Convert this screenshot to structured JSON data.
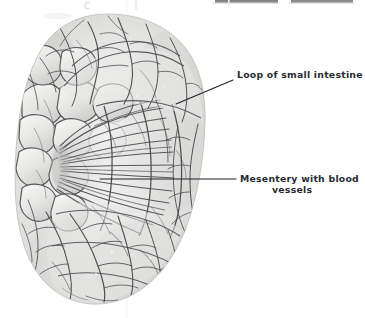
{
  "figure": {
    "kind": "anatomical-illustration",
    "background_color": "#ffffff",
    "ink_color": "#272b33",
    "tissue_light": "#f2f2f1",
    "tissue_mid": "#d8d8d6",
    "tissue_dark": "#9a9a99",
    "vessel_color": "#55575c"
  },
  "labels": [
    {
      "id": "loop-of-small-intestine",
      "lines": [
        "Loop of small intestine"
      ],
      "text_x": 237,
      "text_y": 78,
      "leader": {
        "x1": 176,
        "y1": 104,
        "x2": 233,
        "y2": 80
      }
    },
    {
      "id": "mesentery-with-blood-vessels",
      "lines": [
        "Mesentery with blood",
        "vessels"
      ],
      "text_x": 240,
      "text_y": 181,
      "text_y2": 192,
      "leader": {
        "x1": 100,
        "y1": 179,
        "x2": 236,
        "y2": 179
      }
    }
  ],
  "label_text": {
    "loop_line1": "Loop of small intestine",
    "mesentery_line1": "Mesentery with blood",
    "mesentery_line2": "vessels"
  },
  "scan_artifacts": {
    "top_bar_left": {
      "x": 215,
      "y": 0,
      "width": 63,
      "height": 3
    },
    "top_bar_right": {
      "x": 291,
      "y": 0,
      "width": 62,
      "height": 3
    },
    "partial_glyph": "C",
    "partial_glyph_x": 84,
    "partial_glyph_y": 7,
    "seam_x": 126
  },
  "organ": {
    "bounds": {
      "left": 16,
      "top": 14,
      "right": 205,
      "bottom": 306
    },
    "description": "Kidney-shaped mass of coiled small intestine loops; fan of mesentery radiating from left-centre hub; surface covered with branching blood vessels"
  }
}
